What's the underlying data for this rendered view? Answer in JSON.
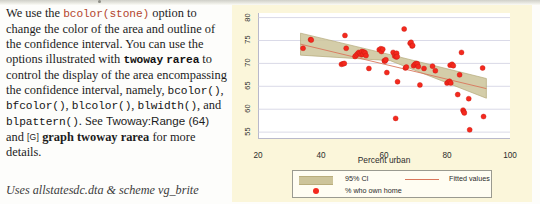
{
  "prose": {
    "seg1": "We use the ",
    "code_bcolor_stone": "bcolor(stone)",
    "seg2": " option to change the color of the area and outline of the confidence interval. You can use the options illustrated with ",
    "code_twoway": "twoway",
    "seg3": " ",
    "code_rarea": "rarea",
    "seg4": " to control the display of the area encompassing the confidence interval, namely, ",
    "code_bcolor": "bcolor()",
    "seg5": ", ",
    "code_bfcolor": "bfcolor()",
    "seg6": ", ",
    "code_blcolor": "blcolor()",
    "seg7": ", ",
    "code_blwidth": "blwidth()",
    "seg8": ", and ",
    "code_blpattern": "blpattern()",
    "seg9": ". See ",
    "ref_twoway_range": "Twoway:Range (64)",
    "seg10": " and ",
    "gbracket": "[G]",
    "seg11": " ",
    "manual_ref": "graph twoway rarea",
    "seg12": " for more details.",
    "uses_line": "Uses allstatesdc.dta & scheme vg_brite"
  },
  "chart_data": {
    "type": "scatter",
    "title": "",
    "xlabel": "Percent urban",
    "ylabel": "",
    "xlim": [
      20,
      100
    ],
    "ylim": [
      53.5,
      81
    ],
    "xticks": [
      20,
      40,
      60,
      80,
      100
    ],
    "yticks": [
      55,
      60,
      65,
      70,
      75,
      80
    ],
    "grid": true,
    "legend_position": "bottom",
    "legend": [
      {
        "key": "ci",
        "label": "95% CI",
        "color": "#cdc49a"
      },
      {
        "key": "fit",
        "label": "Fitted values",
        "color": "#d9765b"
      },
      {
        "key": "points",
        "label": "% who own home",
        "color": "#f4291e"
      }
    ],
    "series": [
      {
        "name": "% who own home",
        "type": "scatter",
        "color": "#f4291e",
        "points": [
          [
            34.3,
            73.3
          ],
          [
            36.7,
            75.2
          ],
          [
            36.9,
            75.1
          ],
          [
            46.5,
            69.8
          ],
          [
            47.0,
            69.9
          ],
          [
            47.4,
            70.0
          ],
          [
            47.6,
            76.1
          ],
          [
            48.0,
            73.3
          ],
          [
            50.8,
            71.5
          ],
          [
            51.2,
            71.8
          ],
          [
            51.6,
            72.1
          ],
          [
            52.0,
            72.4
          ],
          [
            52.4,
            72.2
          ],
          [
            52.8,
            71.9
          ],
          [
            53.0,
            72.6
          ],
          [
            53.3,
            72.0
          ],
          [
            53.6,
            72.5
          ],
          [
            54.0,
            72.3
          ],
          [
            54.3,
            71.7
          ],
          [
            55.2,
            68.9
          ],
          [
            58.5,
            73.0
          ],
          [
            59.0,
            73.2
          ],
          [
            59.2,
            72.6
          ],
          [
            59.6,
            73.1
          ],
          [
            60.1,
            70.6
          ],
          [
            60.3,
            70.5
          ],
          [
            60.6,
            70.8
          ],
          [
            60.9,
            68.0
          ],
          [
            62.9,
            72.4
          ],
          [
            63.4,
            71.6
          ],
          [
            63.6,
            71.9
          ],
          [
            64.0,
            72.2
          ],
          [
            63.9,
            71.4
          ],
          [
            64.2,
            71.5
          ],
          [
            63.7,
            58.0
          ],
          [
            64.3,
            66.0
          ],
          [
            66.4,
            77.5
          ],
          [
            66.8,
            69.0
          ],
          [
            67.1,
            69.2
          ],
          [
            68.3,
            74.4
          ],
          [
            68.6,
            74.6
          ],
          [
            68.9,
            73.8
          ],
          [
            69.1,
            73.9
          ],
          [
            69.4,
            69.5
          ],
          [
            69.8,
            69.8
          ],
          [
            70.2,
            70.0
          ],
          [
            70.6,
            69.9
          ],
          [
            70.9,
            69.3
          ],
          [
            71.4,
            65.3
          ],
          [
            75.4,
            69.4
          ],
          [
            76.3,
            68.4
          ],
          [
            72.7,
            68.9
          ],
          [
            80.0,
            65.7
          ],
          [
            80.4,
            65.9
          ],
          [
            80.8,
            66.1
          ],
          [
            81.2,
            65.7
          ],
          [
            81.0,
            69.6
          ],
          [
            81.6,
            69.8
          ],
          [
            82.0,
            69.5
          ],
          [
            84.0,
            67.5
          ],
          [
            84.6,
            72.4
          ],
          [
            83.4,
            63.2
          ],
          [
            85.1,
            59.8
          ],
          [
            85.3,
            59.5
          ],
          [
            85.5,
            59.2
          ],
          [
            86.9,
            62.3
          ],
          [
            87.2,
            55.5
          ],
          [
            91.3,
            69.0
          ],
          [
            91.6,
            58.4
          ]
        ]
      },
      {
        "name": "Fitted values",
        "type": "line",
        "color": "#d9765b",
        "points": [
          [
            33.5,
            74.2
          ],
          [
            92.5,
            64.5
          ]
        ]
      },
      {
        "name": "95% CI",
        "type": "band",
        "color": "#cdc49a",
        "upper": [
          [
            33.5,
            76.6
          ],
          [
            62.0,
            71.9
          ],
          [
            92.5,
            66.7
          ]
        ],
        "lower": [
          [
            33.5,
            71.8
          ],
          [
            62.0,
            70.6
          ],
          [
            92.5,
            62.4
          ]
        ]
      }
    ]
  }
}
